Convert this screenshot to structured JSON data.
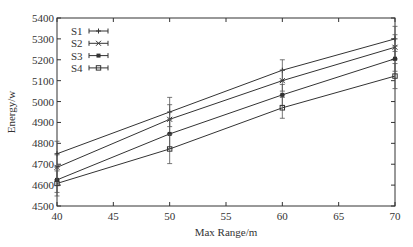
{
  "chart_data": {
    "type": "line",
    "title": "",
    "xlabel": "Max Range/m",
    "ylabel": "Energy/w",
    "x": [
      40,
      50,
      60,
      70
    ],
    "xlim": [
      40,
      70
    ],
    "ylim": [
      4500,
      5400
    ],
    "xticks": [
      40,
      45,
      50,
      55,
      60,
      65,
      70
    ],
    "yticks": [
      4500,
      4600,
      4700,
      4800,
      4900,
      5000,
      5100,
      5200,
      5300,
      5400
    ],
    "grid": false,
    "legend_position": "upper left",
    "error_bars": true,
    "series": [
      {
        "name": "S1",
        "marker": "plus",
        "values": [
          4750,
          4950,
          5150,
          5300
        ],
        "err": [
          60,
          70,
          50,
          60
        ]
      },
      {
        "name": "S2",
        "marker": "x",
        "values": [
          4685,
          4915,
          5100,
          5260
        ],
        "err": [
          60,
          70,
          50,
          60
        ]
      },
      {
        "name": "S3",
        "marker": "asterisk",
        "values": [
          4625,
          4845,
          5032,
          5205
        ],
        "err": [
          60,
          70,
          50,
          60
        ]
      },
      {
        "name": "S4",
        "marker": "square",
        "values": [
          4608,
          4773,
          4970,
          5122
        ],
        "err": [
          60,
          70,
          50,
          60
        ]
      }
    ]
  }
}
